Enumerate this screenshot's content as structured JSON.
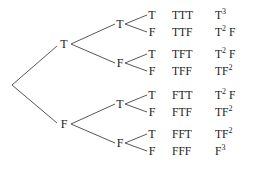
{
  "diagram": {
    "title": "",
    "level1": [
      {
        "label": "T"
      },
      {
        "label": "F"
      }
    ],
    "level2": [
      {
        "label": "T"
      },
      {
        "label": "F"
      },
      {
        "label": "T"
      },
      {
        "label": "F"
      }
    ],
    "leaves": [
      {
        "label": "T",
        "outcome": "TTT",
        "power_base": "T",
        "power_exp": "3",
        "power_rest": ""
      },
      {
        "label": "F",
        "outcome": "TTF",
        "power_base": "T",
        "power_exp": "2",
        "power_rest": " F"
      },
      {
        "label": "T",
        "outcome": "TFT",
        "power_base": "T",
        "power_exp": "2",
        "power_rest": " F"
      },
      {
        "label": "F",
        "outcome": "TFF",
        "power_base": "TF",
        "power_exp": "2",
        "power_rest": ""
      },
      {
        "label": "T",
        "outcome": "FTT",
        "power_base": "T",
        "power_exp": "2",
        "power_rest": " F"
      },
      {
        "label": "F",
        "outcome": "FTF",
        "power_base": "TF",
        "power_exp": "2",
        "power_rest": ""
      },
      {
        "label": "T",
        "outcome": "FFT",
        "power_base": "TF",
        "power_exp": "2",
        "power_rest": ""
      },
      {
        "label": "F",
        "outcome": "FFF",
        "power_base": "F",
        "power_exp": "3",
        "power_rest": ""
      }
    ]
  }
}
